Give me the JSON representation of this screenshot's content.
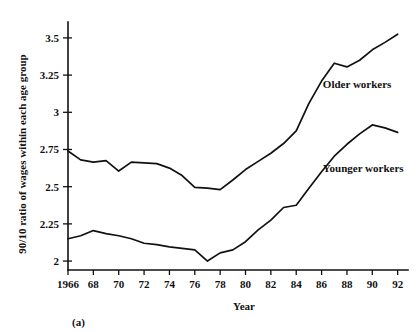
{
  "chart_data": {
    "type": "line",
    "title": "",
    "panel_label": "(a)",
    "xlabel": "Year",
    "ylabel": "90/10 ratio of wages within each age group",
    "xlim": [
      1966,
      1992.5
    ],
    "ylim": [
      1.94,
      3.58
    ],
    "grid": false,
    "legend_position": "inline-annotation",
    "x": [
      1966,
      1967,
      1968,
      1969,
      1970,
      1971,
      1972,
      1973,
      1974,
      1975,
      1976,
      1977,
      1978,
      1979,
      1980,
      1981,
      1982,
      1983,
      1984,
      1985,
      1986,
      1987,
      1988,
      1989,
      1990,
      1991,
      1992
    ],
    "xticks": [
      1966,
      1968,
      1970,
      1972,
      1974,
      1976,
      1978,
      1980,
      1982,
      1984,
      1986,
      1988,
      1990,
      1992
    ],
    "xtick_labels": [
      "1966",
      "68",
      "70",
      "72",
      "74",
      "76",
      "78",
      "80",
      "82",
      "84",
      "86",
      "88",
      "90",
      "92"
    ],
    "yticks": [
      2,
      2.25,
      2.5,
      2.75,
      3,
      3.25,
      3.5
    ],
    "ytick_labels": [
      "2",
      "2.25",
      "2.5",
      "2.75",
      "3",
      "3.25",
      "3.5"
    ],
    "series": [
      {
        "name": "Older workers",
        "label": "Older workers",
        "color": "#111111",
        "label_x": 1986.1,
        "label_y": 3.16,
        "values": [
          2.74,
          2.68,
          2.665,
          2.675,
          2.605,
          2.665,
          2.66,
          2.655,
          2.625,
          2.575,
          2.495,
          2.49,
          2.48,
          2.545,
          2.615,
          2.67,
          2.725,
          2.79,
          2.875,
          3.06,
          3.21,
          3.33,
          3.305,
          3.35,
          3.42,
          3.47,
          3.525
        ]
      },
      {
        "name": "Younger workers",
        "label": "Younger workers",
        "color": "#111111",
        "label_x": 1986.1,
        "label_y": 2.6,
        "values": [
          2.15,
          2.17,
          2.205,
          2.185,
          2.17,
          2.15,
          2.12,
          2.11,
          2.095,
          2.085,
          2.075,
          2.0,
          2.055,
          2.075,
          2.13,
          2.21,
          2.275,
          2.36,
          2.375,
          2.49,
          2.6,
          2.705,
          2.785,
          2.855,
          2.915,
          2.895,
          2.865
        ]
      }
    ]
  },
  "icons": {
    "y_axis": "vertical-axis",
    "x_axis": "horizontal-axis"
  }
}
